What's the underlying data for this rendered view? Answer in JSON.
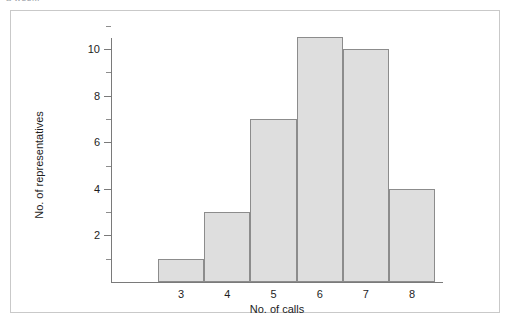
{
  "scan": {
    "top_caption": "a week."
  },
  "chart_data": {
    "type": "bar",
    "title": "",
    "subtitle": "",
    "xlabel": "No. of calls",
    "ylabel": "No. of representatives",
    "categories": [
      "3",
      "4",
      "5",
      "6",
      "7",
      "8"
    ],
    "values": [
      1,
      3,
      7,
      10.5,
      10,
      4
    ],
    "series": [
      {
        "name": "No. of representatives",
        "values": [
          1,
          3,
          7,
          10.5,
          10,
          4
        ]
      }
    ],
    "ylim": [
      0,
      11.5
    ],
    "xlim": [
      2.5,
      8.5
    ],
    "y_major_ticks": [
      2,
      4,
      6,
      8,
      10
    ],
    "y_minor_ticks": [
      1,
      3,
      5,
      7,
      9,
      11
    ],
    "y_tick_labels": [
      "2",
      "4",
      "6",
      "8",
      "10"
    ],
    "x_tick_labels": [
      "3",
      "4",
      "5",
      "6",
      "7",
      "8"
    ],
    "grid": false,
    "legend": false,
    "legend_position": "none",
    "bar_fill_color": "#dedede",
    "bar_border_color": "#8c8c8c",
    "axis_color": "#7a7a7a",
    "frame_color": "#c9c9c9",
    "text_color": "#1d1d1d",
    "background_color": "#ffffff",
    "annotations": []
  }
}
